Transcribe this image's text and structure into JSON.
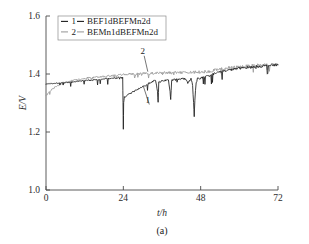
{
  "figure": {
    "caption": "(a)"
  },
  "chart_data": {
    "type": "line",
    "title": "",
    "xlabel": "t/h",
    "ylabel": "E/V",
    "xlim": [
      0,
      72
    ],
    "ylim": [
      1.0,
      1.6
    ],
    "xticks": [
      0,
      24,
      48,
      72
    ],
    "xtick_labels": [
      "0",
      "24",
      "48",
      "72"
    ],
    "yticks": [
      1.0,
      1.2,
      1.4,
      1.6
    ],
    "ytick_labels": [
      "1.0",
      "1.2",
      "1.4",
      "1.6"
    ],
    "grid": false,
    "legend_position": "top-left",
    "series": [
      {
        "key": "1",
        "name": "BEF1dBEFMn2d",
        "color": "#1c1c1c",
        "x": [
          0,
          1,
          2,
          3,
          4,
          5,
          6,
          7,
          8,
          9,
          10,
          11,
          12,
          13,
          14,
          15,
          16,
          17,
          18,
          19,
          20,
          21,
          22,
          23,
          23.6,
          23.8,
          23.9,
          24.0,
          24.1,
          24.3,
          25,
          26,
          27,
          28,
          29,
          30,
          31,
          32,
          33,
          34,
          34.6,
          34.8,
          35,
          36,
          37,
          38,
          38.5,
          38.7,
          39,
          40,
          41,
          42,
          43,
          44,
          45,
          45.5,
          45.8,
          46.0,
          46.2,
          46.6,
          47,
          48,
          49,
          50,
          51,
          52,
          53,
          54,
          55,
          56,
          57,
          58,
          59,
          60,
          61,
          62,
          63,
          64,
          65,
          66,
          67,
          68,
          69,
          70,
          71,
          72
        ],
        "y": [
          1.365,
          1.366,
          1.367,
          1.368,
          1.369,
          1.37,
          1.371,
          1.372,
          1.373,
          1.374,
          1.375,
          1.376,
          1.377,
          1.378,
          1.379,
          1.38,
          1.381,
          1.382,
          1.383,
          1.384,
          1.385,
          1.386,
          1.387,
          1.388,
          1.389,
          1.39,
          1.3,
          1.21,
          1.3,
          1.32,
          1.326,
          1.332,
          1.338,
          1.344,
          1.35,
          1.356,
          1.362,
          1.368,
          1.374,
          1.378,
          1.34,
          1.3,
          1.372,
          1.376,
          1.378,
          1.38,
          1.34,
          1.31,
          1.378,
          1.38,
          1.382,
          1.383,
          1.384,
          1.37,
          1.384,
          1.36,
          1.3,
          1.25,
          1.31,
          1.37,
          1.384,
          1.386,
          1.388,
          1.392,
          1.396,
          1.4,
          1.404,
          1.408,
          1.41,
          1.412,
          1.414,
          1.416,
          1.418,
          1.42,
          1.421,
          1.422,
          1.423,
          1.424,
          1.425,
          1.426,
          1.427,
          1.428,
          1.429,
          1.43,
          1.431,
          1.432
        ]
      },
      {
        "key": "2",
        "name": "BEMn1dBEFMn2d",
        "color": "#9d9d9d",
        "x": [
          0,
          1,
          2,
          3,
          4,
          5,
          6,
          7,
          8,
          9,
          10,
          11,
          12,
          13,
          14,
          15,
          16,
          17,
          18,
          19,
          20,
          21,
          22,
          23,
          24,
          25,
          26,
          27,
          28,
          29,
          30,
          31,
          32,
          33,
          34,
          35,
          36,
          37,
          38,
          39,
          40,
          41,
          42,
          43,
          44,
          45,
          46,
          47,
          48,
          49,
          50,
          51,
          52,
          53,
          54,
          55,
          56,
          57,
          58,
          59,
          60,
          61,
          62,
          63,
          64,
          65,
          66,
          67,
          68,
          69,
          70,
          71,
          72
        ],
        "y": [
          1.325,
          1.338,
          1.348,
          1.356,
          1.362,
          1.367,
          1.371,
          1.374,
          1.377,
          1.379,
          1.381,
          1.383,
          1.385,
          1.387,
          1.388,
          1.389,
          1.39,
          1.391,
          1.392,
          1.393,
          1.394,
          1.395,
          1.396,
          1.397,
          1.398,
          1.399,
          1.4,
          1.4,
          1.401,
          1.401,
          1.402,
          1.402,
          1.402,
          1.403,
          1.403,
          1.403,
          1.404,
          1.404,
          1.404,
          1.404,
          1.405,
          1.405,
          1.405,
          1.405,
          1.406,
          1.406,
          1.406,
          1.407,
          1.407,
          1.408,
          1.409,
          1.41,
          1.412,
          1.414,
          1.416,
          1.418,
          1.42,
          1.421,
          1.422,
          1.423,
          1.424,
          1.425,
          1.426,
          1.427,
          1.428,
          1.429,
          1.43,
          1.43,
          1.431,
          1.431,
          1.432,
          1.432,
          1.433
        ]
      }
    ],
    "annotations": [
      {
        "label": "2",
        "x": 30.0,
        "y": 1.468,
        "target_x": 31.6,
        "target_y": 1.408
      },
      {
        "label": "1",
        "x": 31.6,
        "y": 1.3,
        "target_x": 30.2,
        "target_y": 1.358
      }
    ]
  },
  "legend": {
    "entries": [
      {
        "marker": "1",
        "label": "BEF1dBEFMn2d"
      },
      {
        "marker": "2",
        "label": "BEMn1dBEFMn2d"
      }
    ]
  }
}
